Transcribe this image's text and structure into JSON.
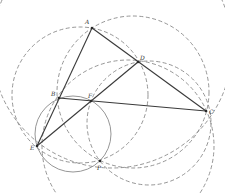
{
  "diagram": {
    "type": "geometry-construction",
    "points": {
      "A": {
        "label": "A",
        "x": 92,
        "y": 28,
        "lx": 85,
        "ly": 24
      },
      "B": {
        "label": "B",
        "x": 59,
        "y": 98,
        "lx": 51,
        "ly": 96
      },
      "C": {
        "label": "C",
        "x": 206,
        "y": 111,
        "lx": 209,
        "ly": 114
      },
      "D": {
        "label": "D",
        "x": 138,
        "y": 62,
        "lx": 140,
        "ly": 60
      },
      "E": {
        "label": "E",
        "x": 37,
        "y": 146,
        "lx": 30,
        "ly": 150
      },
      "F": {
        "label": "F",
        "x": 91,
        "y": 101,
        "lx": 88,
        "ly": 98
      },
      "P": {
        "label": "P",
        "x": 100,
        "y": 161,
        "lx": 97,
        "ly": 170
      }
    },
    "segments": [
      {
        "from": "A",
        "to": "E"
      },
      {
        "from": "A",
        "to": "C"
      },
      {
        "from": "B",
        "to": "C"
      },
      {
        "from": "E",
        "to": "D"
      }
    ],
    "circles": [
      {
        "name": "circle-ACP",
        "cx": 133,
        "cy": 92,
        "r": 76,
        "style": "dashed"
      },
      {
        "name": "circle-ADPE",
        "cx": 80,
        "cy": 95,
        "r": 68,
        "style": "dashed"
      },
      {
        "name": "circle-BEFP",
        "cx": 73,
        "cy": 134,
        "r": 38,
        "style": "solid"
      },
      {
        "name": "circle-DCP",
        "cx": 149,
        "cy": 123,
        "r": 62,
        "style": "dashed"
      },
      {
        "name": "circle-BDCE",
        "cx": 128,
        "cy": 146,
        "r": 86,
        "style": "dashed"
      },
      {
        "name": "circle-EPC",
        "cx": 112,
        "cy": 48,
        "r": 120,
        "style": "dashed"
      }
    ],
    "colors": {
      "segment": "#3a3a3a",
      "circle": "#8a8a8a",
      "background": "#ffffff"
    }
  }
}
